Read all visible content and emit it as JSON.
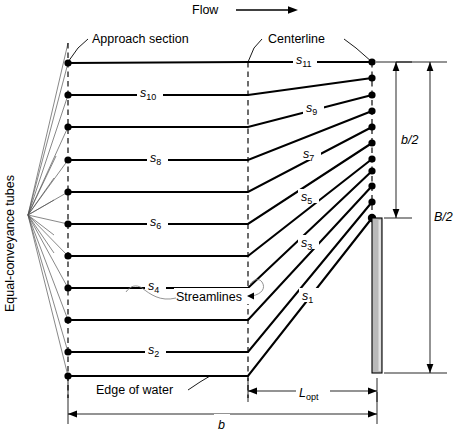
{
  "figure": {
    "title_flow": "Flow",
    "labels": {
      "approach_section": "Approach section",
      "centerline": "Centerline",
      "streamlines": "Streamlines",
      "edge_of_water": "Edge of water",
      "equal_conveyance_tubes": "Equal-conveyance tubes"
    },
    "dimensions": {
      "half_bridge_opening": "b/2",
      "half_floodplain_width": "B/2",
      "optimum_length_base": "L",
      "optimum_length_sub": "opt",
      "channel_width": "b"
    },
    "streamlines": {
      "prefix": "s",
      "items": [
        {
          "id": "s1",
          "base": "s",
          "sub": "1"
        },
        {
          "id": "s2",
          "base": "s",
          "sub": "2"
        },
        {
          "id": "s3",
          "base": "s",
          "sub": "3"
        },
        {
          "id": "s4",
          "base": "s",
          "sub": "4"
        },
        {
          "id": "s5",
          "base": "s",
          "sub": "5"
        },
        {
          "id": "s6",
          "base": "s",
          "sub": "6"
        },
        {
          "id": "s7",
          "base": "s",
          "sub": "7"
        },
        {
          "id": "s8",
          "base": "s",
          "sub": "8"
        },
        {
          "id": "s9",
          "base": "s",
          "sub": "9"
        },
        {
          "id": "s10",
          "base": "s",
          "sub": "10"
        },
        {
          "id": "s11",
          "base": "s",
          "sub": "11"
        }
      ]
    },
    "geometry": {
      "approach_x": 68,
      "centerline_x": 248,
      "right_edge_x": 372,
      "left_fan_apex_x": 28,
      "left_fan_apex_y": 215,
      "left_rows_y": [
        63,
        95,
        127,
        160,
        192,
        224,
        256,
        288,
        320,
        352,
        376
      ],
      "right_rows_y": [
        62,
        78,
        95,
        111,
        127,
        143,
        159,
        171,
        186,
        202,
        218
      ],
      "pier_top_y": 218,
      "pier_bottom_y": 373,
      "baseline_y": 376
    },
    "colors": {
      "ink": "#000000",
      "pier_fill": "#b9b9b9",
      "leader_gray": "#777777",
      "background": "#ffffff"
    }
  }
}
